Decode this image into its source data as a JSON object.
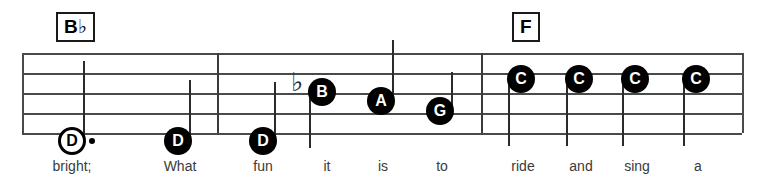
{
  "score": {
    "type": "music-notation-staff",
    "staff": {
      "line_count": 5,
      "top": 53,
      "bottom": 133,
      "left": 22,
      "right": 742,
      "line_spacing": 20,
      "color": "#4a4a4a"
    },
    "barlines": [
      {
        "name": "barline-1",
        "x": 217
      },
      {
        "name": "barline-2",
        "x": 481
      }
    ],
    "chords": [
      {
        "name": "chord-bb",
        "label": "B",
        "accidental": "♭",
        "full": "B♭",
        "x": 56,
        "y": 12
      },
      {
        "name": "chord-f",
        "label": "F",
        "accidental": "",
        "full": "F",
        "x": 512,
        "y": 12
      }
    ],
    "notes": [
      {
        "name": "note-d-1",
        "letter": "D",
        "head": "hollow",
        "dotted": true,
        "accidental": "",
        "cx": 72,
        "cy": 141,
        "stem": "up",
        "stem_top": 61,
        "lyric": "bright;"
      },
      {
        "name": "note-d-2",
        "letter": "D",
        "head": "filled",
        "dotted": false,
        "accidental": "",
        "cx": 178,
        "cy": 141,
        "stem": "up",
        "stem_top": 80,
        "lyric": "What"
      },
      {
        "name": "note-d-3",
        "letter": "D",
        "head": "filled",
        "dotted": false,
        "accidental": "",
        "cx": 263,
        "cy": 141,
        "stem": "up",
        "stem_top": 82,
        "lyric": "fun"
      },
      {
        "name": "note-b-flat",
        "letter": "B",
        "head": "filled",
        "dotted": false,
        "accidental": "♭",
        "cx": 322,
        "cy": 92,
        "stem": "down",
        "stem_bottom": 148,
        "lyric": "it"
      },
      {
        "name": "note-a",
        "letter": "A",
        "head": "filled",
        "dotted": false,
        "accidental": "",
        "cx": 381,
        "cy": 101,
        "stem": "up",
        "stem_top": 40,
        "lyric": "is"
      },
      {
        "name": "note-g",
        "letter": "G",
        "head": "filled",
        "dotted": false,
        "accidental": "",
        "cx": 440,
        "cy": 111,
        "stem": "up",
        "stem_top": 72,
        "lyric": "to"
      },
      {
        "name": "note-c-1",
        "letter": "C",
        "head": "filled",
        "dotted": false,
        "accidental": "",
        "cx": 521,
        "cy": 79,
        "stem": "down",
        "stem_bottom": 146,
        "lyric": "ride"
      },
      {
        "name": "note-c-2",
        "letter": "C",
        "head": "filled",
        "dotted": false,
        "accidental": "",
        "cx": 579,
        "cy": 79,
        "stem": "down",
        "stem_bottom": 146,
        "lyric": "and"
      },
      {
        "name": "note-c-3",
        "letter": "C",
        "head": "filled",
        "dotted": false,
        "accidental": "",
        "cx": 635,
        "cy": 79,
        "stem": "down",
        "stem_bottom": 146,
        "lyric": "sing"
      },
      {
        "name": "note-c-4",
        "letter": "C",
        "head": "filled",
        "dotted": false,
        "accidental": "",
        "cx": 696,
        "cy": 79,
        "stem": "down",
        "stem_bottom": 146,
        "lyric": "a"
      }
    ],
    "lyrics": [
      {
        "text": "bright;",
        "x": 72,
        "y": 158
      },
      {
        "text": "What",
        "x": 180,
        "y": 158
      },
      {
        "text": "fun",
        "x": 263,
        "y": 158
      },
      {
        "text": "it",
        "x": 327,
        "y": 158
      },
      {
        "text": "is",
        "x": 383,
        "y": 158
      },
      {
        "text": "to",
        "x": 442,
        "y": 158
      },
      {
        "text": "ride",
        "x": 523,
        "y": 158
      },
      {
        "text": "and",
        "x": 581,
        "y": 158
      },
      {
        "text": "sing",
        "x": 637,
        "y": 158
      },
      {
        "text": "a",
        "x": 698,
        "y": 158
      }
    ]
  }
}
